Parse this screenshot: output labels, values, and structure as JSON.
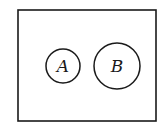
{
  "diagram": {
    "type": "venn",
    "universe": {
      "label": ""
    },
    "sets": [
      {
        "label": "A",
        "cx": 63,
        "cy": 66,
        "r": 17
      },
      {
        "label": "B",
        "cx": 117,
        "cy": 66,
        "r": 23
      }
    ],
    "relationship": "disjoint",
    "stroke_color": "#1a1a1a"
  }
}
